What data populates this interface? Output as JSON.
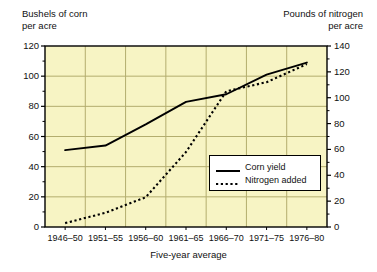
{
  "chart_data": {
    "type": "line",
    "title": "",
    "xlabel": "Five-year average",
    "categories": [
      "1946–50",
      "1951–55",
      "1956–60",
      "1961–65",
      "1966–70",
      "1971–75",
      "1976–80"
    ],
    "grid": true,
    "legend_position": "inside-lower-right",
    "axes": {
      "left": {
        "label": "Bushels of corn\nper acre",
        "label_line1": "Bushels of corn",
        "label_line2": "per acre",
        "ticks": [
          0,
          20,
          40,
          60,
          80,
          100,
          120
        ],
        "ylim": [
          0,
          120
        ]
      },
      "right": {
        "label": "Pounds of nitrogen\nper acre",
        "label_line1": "Pounds of nitrogen",
        "label_line2": "per acre",
        "ticks": [
          0,
          20,
          40,
          60,
          80,
          100,
          120,
          140
        ],
        "ylim": [
          0,
          140
        ]
      }
    },
    "series": [
      {
        "name": "Corn yield",
        "axis": "left",
        "style": "solid",
        "color": "#000000",
        "values": [
          51,
          54,
          68,
          83,
          88,
          101,
          109
        ]
      },
      {
        "name": "Nitrogen added",
        "axis": "right",
        "style": "dotted",
        "color": "#000000",
        "values": [
          3,
          11,
          23,
          58,
          105,
          112,
          126
        ]
      }
    ],
    "colors": {
      "plot_background": "#f7f4c4",
      "gridline": "#b3ad6e",
      "axis": "#000000",
      "legend_background": "#ffffff"
    }
  }
}
